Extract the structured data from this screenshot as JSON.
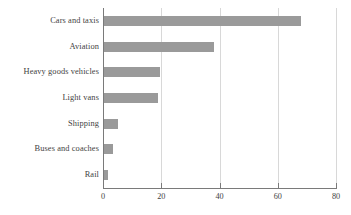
{
  "chart_data": {
    "type": "bar",
    "orientation": "horizontal",
    "title": "",
    "subtitle": "",
    "xlabel": "",
    "ylabel": "",
    "categories": [
      "Cars and taxis",
      "Aviation",
      "Heavy goods vehicles",
      "Light vans",
      "Shipping",
      "Buses and coaches",
      "Rail"
    ],
    "values": [
      68,
      38,
      19.5,
      19,
      5,
      3.5,
      1.7
    ],
    "xlim": [
      0,
      80
    ],
    "x_ticks": [
      0,
      20,
      40,
      60,
      80
    ],
    "x_tick_labels": [
      "0",
      "20",
      "40",
      "60",
      "80"
    ],
    "grid": "vertical",
    "legend": "none",
    "bar_color": "#9a9a9a",
    "axis_color": "#7a7a7a",
    "gridline_color": "#d8d8d8",
    "text_color": "#3f3f3f"
  }
}
